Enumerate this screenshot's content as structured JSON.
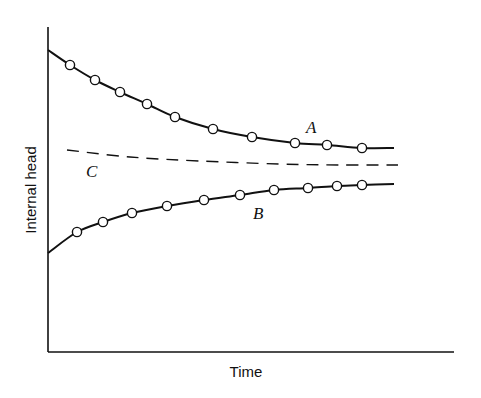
{
  "chart_data": {
    "type": "line",
    "title": "",
    "xlabel": "Time",
    "ylabel": "Internal head",
    "grid": false,
    "legend": "inline labels",
    "axes_ticks": "none",
    "series": [
      {
        "name": "A",
        "style": "solid line with open circle markers",
        "trend": "decreasing, approaching asymptote from above",
        "line_start": [
          0.0,
          0.93
        ],
        "line_end": [
          0.86,
          0.63
        ],
        "points": [
          {
            "x": 0.05,
            "y": 0.88
          },
          {
            "x": 0.12,
            "y": 0.84
          },
          {
            "x": 0.18,
            "y": 0.8
          },
          {
            "x": 0.24,
            "y": 0.77
          },
          {
            "x": 0.31,
            "y": 0.73
          },
          {
            "x": 0.41,
            "y": 0.69
          },
          {
            "x": 0.5,
            "y": 0.66
          },
          {
            "x": 0.61,
            "y": 0.64
          },
          {
            "x": 0.69,
            "y": 0.64
          },
          {
            "x": 0.77,
            "y": 0.63
          }
        ]
      },
      {
        "name": "B",
        "style": "solid line with open circle markers",
        "trend": "increasing, approaching asymptote from below",
        "line_start": [
          0.0,
          0.31
        ],
        "line_end": [
          0.86,
          0.52
        ],
        "points": [
          {
            "x": 0.07,
            "y": 0.37
          },
          {
            "x": 0.13,
            "y": 0.4
          },
          {
            "x": 0.21,
            "y": 0.43
          },
          {
            "x": 0.29,
            "y": 0.45
          },
          {
            "x": 0.38,
            "y": 0.47
          },
          {
            "x": 0.47,
            "y": 0.48
          },
          {
            "x": 0.56,
            "y": 0.5
          },
          {
            "x": 0.64,
            "y": 0.51
          },
          {
            "x": 0.71,
            "y": 0.51
          },
          {
            "x": 0.77,
            "y": 0.52
          }
        ]
      },
      {
        "name": "C",
        "style": "dashed line, no markers",
        "trend": "slightly decreasing, nearly flat asymptote",
        "line_start": [
          0.05,
          0.62
        ],
        "line_end": [
          0.87,
          0.58
        ]
      }
    ],
    "xlim": [
      0,
      1
    ],
    "ylim": [
      0,
      1
    ]
  },
  "labels": {
    "x_axis": "Time",
    "y_axis": "Internal head",
    "series_a": "A",
    "series_b": "B",
    "series_c": "C"
  },
  "plot_px": {
    "x0": 48,
    "x1": 454,
    "y_top": 27,
    "y_bottom": 352,
    "a_line": [
      [
        48,
        50
      ],
      [
        70,
        65
      ],
      [
        95,
        80
      ],
      [
        120,
        92
      ],
      [
        147,
        104
      ],
      [
        175,
        117
      ],
      [
        213,
        129
      ],
      [
        252,
        137
      ],
      [
        295,
        143
      ],
      [
        327,
        145
      ],
      [
        362,
        148
      ],
      [
        394,
        148
      ]
    ],
    "a_markers": [
      [
        70,
        65
      ],
      [
        95,
        80
      ],
      [
        120,
        92
      ],
      [
        147,
        104
      ],
      [
        175,
        117
      ],
      [
        213,
        129
      ],
      [
        252,
        137
      ],
      [
        295,
        143
      ],
      [
        327,
        145
      ],
      [
        362,
        148
      ]
    ],
    "b_line": [
      [
        48,
        253
      ],
      [
        77,
        232
      ],
      [
        103,
        222
      ],
      [
        132,
        213
      ],
      [
        167,
        206
      ],
      [
        204,
        200
      ],
      [
        240,
        195
      ],
      [
        274,
        190
      ],
      [
        308,
        188
      ],
      [
        337,
        186
      ],
      [
        362,
        185
      ],
      [
        394,
        184
      ]
    ],
    "b_markers": [
      [
        77,
        232
      ],
      [
        103,
        222
      ],
      [
        132,
        213
      ],
      [
        167,
        206
      ],
      [
        204,
        200
      ],
      [
        240,
        195
      ],
      [
        274,
        190
      ],
      [
        308,
        188
      ],
      [
        337,
        186
      ],
      [
        362,
        185
      ]
    ],
    "c_line": [
      [
        67,
        150
      ],
      [
        130,
        157
      ],
      [
        200,
        161
      ],
      [
        280,
        164
      ],
      [
        340,
        165
      ],
      [
        398,
        165
      ]
    ]
  }
}
